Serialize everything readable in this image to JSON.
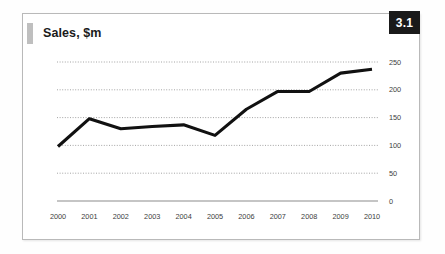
{
  "panel": {
    "figure_number": "3.1"
  },
  "chart_data": {
    "type": "line",
    "title": "Sales, $m",
    "xlabel": "",
    "ylabel": "",
    "categories": [
      "2000",
      "2001",
      "2002",
      "2003",
      "2004",
      "2005",
      "2006",
      "2007",
      "2008",
      "2009",
      "2010"
    ],
    "series": [
      {
        "name": "Sales, $m",
        "values": [
          98,
          148,
          130,
          134,
          137,
          118,
          165,
          197,
          197,
          230,
          237
        ],
        "color": "#111111"
      }
    ],
    "ylim": [
      0,
      250
    ],
    "yticks": [
      0,
      50,
      100,
      150,
      200,
      250
    ],
    "ytick_labels": [
      "0",
      "50",
      "100",
      "150",
      "200",
      "250"
    ],
    "grid": true,
    "grid_style": "dotted",
    "grid_color": "#9a9a9a",
    "legend": false,
    "legend_position": "none",
    "axis_line_color": "#8c8c8c",
    "baseline_value": 0
  }
}
